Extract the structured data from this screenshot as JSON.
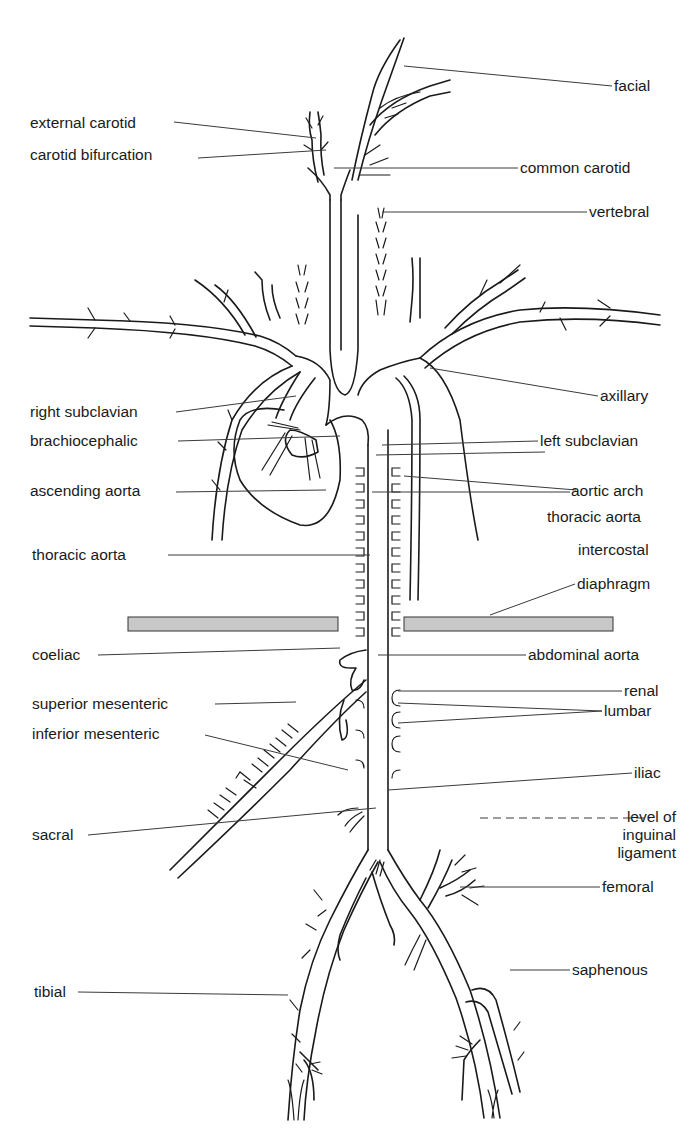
{
  "figure": {
    "colors": {
      "ink": "#1a1a1a",
      "leader": "#3a3a3a",
      "diaphragm_fill": "#c8c8c8",
      "background": "#ffffff"
    }
  },
  "labels_left": [
    {
      "id": "external-carotid",
      "text": "external carotid"
    },
    {
      "id": "carotid-bifurcation",
      "text": "carotid bifurcation"
    },
    {
      "id": "right-subclavian",
      "text": "right subclavian"
    },
    {
      "id": "brachiocephalic",
      "text": "brachiocephalic"
    },
    {
      "id": "ascending-aorta",
      "text": "ascending aorta"
    },
    {
      "id": "thoracic-aorta-left",
      "text": "thoracic aorta"
    },
    {
      "id": "coeliac",
      "text": "coeliac"
    },
    {
      "id": "superior-mesenteric",
      "text": "superior mesenteric"
    },
    {
      "id": "inferior-mesenteric",
      "text": "inferior mesenteric"
    },
    {
      "id": "sacral",
      "text": "sacral"
    },
    {
      "id": "tibial",
      "text": "tibial"
    }
  ],
  "labels_right": [
    {
      "id": "facial",
      "text": "facial"
    },
    {
      "id": "common-carotid",
      "text": "common carotid"
    },
    {
      "id": "vertebral",
      "text": "vertebral"
    },
    {
      "id": "axillary",
      "text": "axillary"
    },
    {
      "id": "left-subclavian",
      "text": "left subclavian"
    },
    {
      "id": "aortic-arch",
      "text": "aortic arch"
    },
    {
      "id": "thoracic-aorta-right",
      "text": "thoracic aorta"
    },
    {
      "id": "intercostal",
      "text": "intercostal"
    },
    {
      "id": "diaphragm",
      "text": "diaphragm"
    },
    {
      "id": "abdominal-aorta",
      "text": "abdominal aorta"
    },
    {
      "id": "renal",
      "text": "renal"
    },
    {
      "id": "lumbar",
      "text": "lumbar"
    },
    {
      "id": "iliac",
      "text": "iliac"
    },
    {
      "id": "inguinal-ligament",
      "text": "level of\ninguinal\nligament"
    },
    {
      "id": "femoral",
      "text": "femoral"
    },
    {
      "id": "saphenous",
      "text": "saphenous"
    }
  ]
}
